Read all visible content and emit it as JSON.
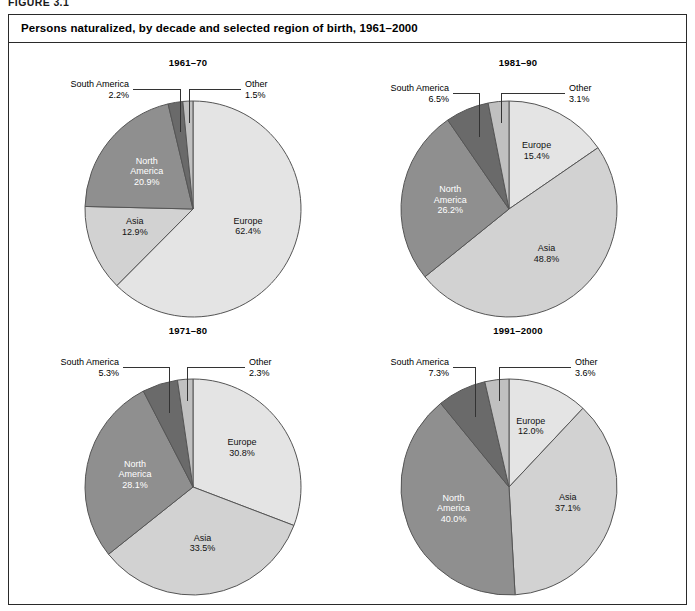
{
  "figure": {
    "label": "FIGURE 3.1"
  },
  "header": {
    "title": "Persons naturalized, by decade and selected region of birth, 1961–2000"
  },
  "colors": {
    "europe": "#e4e4e4",
    "asia": "#d2d2d2",
    "north_america": "#8f8f8f",
    "south_america": "#6a6a6a",
    "other": "#c0c0c0",
    "outline": "#555555",
    "frame": "#2a2a2a",
    "label_light": "#ffffff",
    "label_dark": "#111111"
  },
  "chart_data": [
    {
      "type": "pie",
      "title": "1961–70",
      "categories": [
        "Europe",
        "Asia",
        "North America",
        "South America",
        "Other"
      ],
      "values": [
        62.4,
        12.9,
        20.9,
        2.2,
        1.5
      ],
      "labels": [
        "Europe\n62.4%",
        "Asia\n12.9%",
        "North\nAmerica\n20.9%",
        "South America\n2.2%",
        "Other\n1.5%"
      ],
      "inside": [
        true,
        true,
        true,
        false,
        false
      ],
      "unit": "%"
    },
    {
      "type": "pie",
      "title": "1981–90",
      "categories": [
        "Europe",
        "Asia",
        "North America",
        "South America",
        "Other"
      ],
      "values": [
        15.4,
        48.8,
        26.2,
        6.5,
        3.1
      ],
      "labels": [
        "Europe\n15.4%",
        "Asia\n48.8%",
        "North\nAmerica\n26.2%",
        "South America\n6.5%",
        "Other\n3.1%"
      ],
      "inside": [
        true,
        true,
        true,
        false,
        false
      ],
      "unit": "%"
    },
    {
      "type": "pie",
      "title": "1971–80",
      "categories": [
        "Europe",
        "Asia",
        "North America",
        "South America",
        "Other"
      ],
      "values": [
        30.8,
        33.5,
        28.1,
        5.3,
        2.3
      ],
      "labels": [
        "Europe\n30.8%",
        "Asia\n33.5%",
        "North\nAmerica\n28.1%",
        "South America\n5.3%",
        "Other\n2.3%"
      ],
      "inside": [
        true,
        true,
        true,
        false,
        false
      ],
      "unit": "%"
    },
    {
      "type": "pie",
      "title": "1991–2000",
      "categories": [
        "Europe",
        "Asia",
        "North America",
        "South America",
        "Other"
      ],
      "values": [
        12.0,
        37.1,
        40.0,
        7.3,
        3.6
      ],
      "labels": [
        "Europe\n12.0%",
        "Asia\n37.1%",
        "North\nAmerica\n40.0%",
        "South America\n7.3%",
        "Other\n3.6%"
      ],
      "inside": [
        true,
        true,
        true,
        false,
        false
      ],
      "unit": "%"
    }
  ],
  "panels": [
    {
      "title": "1961–70",
      "callout_left": {
        "text": "South America\n2.2%"
      },
      "callout_right": {
        "text": "Other\n1.5%"
      },
      "inside_labels": [
        {
          "name": "europe",
          "text": "Europe\n62.4%"
        },
        {
          "name": "asia",
          "text": "Asia\n12.9%"
        },
        {
          "name": "north-america",
          "text": "North\nAmerica\n20.9%"
        }
      ]
    },
    {
      "title": "1981–90",
      "callout_left": {
        "text": "South America\n6.5%"
      },
      "callout_right": {
        "text": "Other\n3.1%"
      },
      "inside_labels": [
        {
          "name": "europe",
          "text": "Europe\n15.4%"
        },
        {
          "name": "asia",
          "text": "Asia\n48.8%"
        },
        {
          "name": "north-america",
          "text": "North\nAmerica\n26.2%"
        }
      ]
    },
    {
      "title": "1971–80",
      "callout_left": {
        "text": "South America\n5.3%"
      },
      "callout_right": {
        "text": "Other\n2.3%"
      },
      "inside_labels": [
        {
          "name": "europe",
          "text": "Europe\n30.8%"
        },
        {
          "name": "asia",
          "text": "Asia\n33.5%"
        },
        {
          "name": "north-america",
          "text": "North\nAmerica\n28.1%"
        }
      ]
    },
    {
      "title": "1991–2000",
      "callout_left": {
        "text": "South America\n7.3%"
      },
      "callout_right": {
        "text": "Other\n3.6%"
      },
      "inside_labels": [
        {
          "name": "europe",
          "text": "Europe\n12.0%"
        },
        {
          "name": "asia",
          "text": "Asia\n37.1%"
        },
        {
          "name": "north-america",
          "text": "North\nAmerica\n40.0%"
        }
      ]
    }
  ]
}
